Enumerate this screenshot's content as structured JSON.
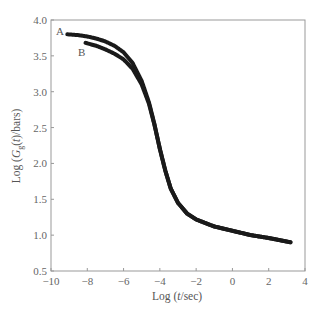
{
  "chart_data": {
    "type": "scatter",
    "title": "",
    "xlabel": "Log (t/sec)",
    "ylabel": "Log (G_g(t)/bars)",
    "xlim": [
      -10,
      4
    ],
    "ylim": [
      0.5,
      4.0
    ],
    "x_ticks": [
      -10,
      -8,
      -6,
      -4,
      -2,
      0,
      2,
      4
    ],
    "x_tick_labels": [
      "−10",
      "−8",
      "−6",
      "−4",
      "−2",
      "0",
      "2",
      "4"
    ],
    "y_ticks": [
      0.5,
      1.0,
      1.5,
      2.0,
      2.5,
      3.0,
      3.5,
      4.0
    ],
    "y_tick_labels": [
      "0.5",
      "1.0",
      "1.5",
      "2.0",
      "2.5",
      "3.0",
      "3.5",
      "4.0"
    ],
    "grid": false,
    "legend": "none (curves labeled inline A and B)",
    "series": [
      {
        "name": "A",
        "x": [
          -9.1,
          -8.5,
          -8.0,
          -7.5,
          -7.0,
          -6.5,
          -6.0,
          -5.5,
          -5.0,
          -4.6,
          -4.3,
          -4.0,
          -3.7,
          -3.4,
          -3.0,
          -2.5,
          -2.0,
          -1.5,
          -1.0,
          0.0,
          1.0,
          2.0,
          3.2
        ],
        "y": [
          3.8,
          3.79,
          3.77,
          3.74,
          3.7,
          3.64,
          3.55,
          3.4,
          3.15,
          2.85,
          2.55,
          2.2,
          1.9,
          1.65,
          1.45,
          1.3,
          1.22,
          1.17,
          1.12,
          1.06,
          1.0,
          0.96,
          0.9
        ]
      },
      {
        "name": "B",
        "x": [
          -8.1,
          -7.5,
          -7.0,
          -6.5,
          -6.0,
          -5.5,
          -5.0,
          -4.6,
          -4.3,
          -4.0,
          -3.7,
          -3.4,
          -3.0,
          -2.5,
          -2.0,
          -1.5,
          -1.0,
          0.0,
          1.0,
          2.0,
          3.2
        ],
        "y": [
          3.68,
          3.64,
          3.59,
          3.53,
          3.45,
          3.32,
          3.1,
          2.83,
          2.54,
          2.2,
          1.9,
          1.65,
          1.45,
          1.3,
          1.22,
          1.17,
          1.12,
          1.06,
          1.0,
          0.96,
          0.9
        ]
      }
    ],
    "annotations": [
      {
        "text": "A",
        "x": -9.7,
        "y": 3.83
      },
      {
        "text": "B",
        "x": -7.9,
        "y": 3.48
      }
    ]
  },
  "labels": {
    "xlabel_prefix": "Log (",
    "xlabel_var": "t",
    "xlabel_suffix": "/sec)",
    "ylabel_prefix": "Log (",
    "ylabel_G": "G",
    "ylabel_sub": "g",
    "ylabel_mid": "(",
    "ylabel_var": "t",
    "ylabel_suffix": ")/bars)",
    "curve_a": "A",
    "curve_b": "B"
  }
}
